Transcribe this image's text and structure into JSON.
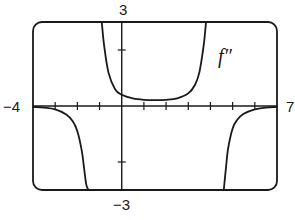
{
  "chart_data": {
    "type": "line",
    "title": "",
    "xlabel": "",
    "ylabel": "",
    "xlim": [
      -4,
      7
    ],
    "ylim": [
      -3,
      3
    ],
    "grid": false,
    "legend": null,
    "x_ticks": [
      -3,
      -2,
      -1,
      0,
      1,
      2,
      3,
      4,
      5,
      6
    ],
    "y_ticks": [
      -2,
      2
    ],
    "tick_labels": {
      "x_min": "−4",
      "x_max": "7",
      "y_max": "3",
      "y_min": "−3"
    },
    "annotations": [
      {
        "text": "f″",
        "x": 4.3,
        "y": 1.7
      }
    ],
    "series": [
      {
        "name": "f'' left branch",
        "x": [
          -4.0,
          -3.5,
          -3.0,
          -2.5,
          -2.2,
          -2.0,
          -1.8,
          -1.7,
          -1.6,
          -1.5
        ],
        "y": [
          -0.03,
          -0.06,
          -0.12,
          -0.3,
          -0.55,
          -0.9,
          -1.6,
          -2.2,
          -2.8,
          -3.0
        ]
      },
      {
        "name": "f'' middle branch",
        "x": [
          -0.9,
          -0.8,
          -0.6,
          -0.3,
          0.0,
          0.5,
          1.0,
          1.5,
          2.0,
          2.5,
          3.0,
          3.3,
          3.5,
          3.7,
          3.8
        ],
        "y": [
          3.0,
          2.2,
          1.2,
          0.6,
          0.4,
          0.27,
          0.22,
          0.21,
          0.22,
          0.27,
          0.45,
          0.75,
          1.2,
          2.2,
          3.0
        ]
      },
      {
        "name": "f'' right branch",
        "x": [
          4.6,
          4.7,
          4.8,
          5.0,
          5.2,
          5.5,
          6.0,
          6.5,
          7.0
        ],
        "y": [
          -3.0,
          -2.2,
          -1.5,
          -0.8,
          -0.5,
          -0.28,
          -0.12,
          -0.06,
          -0.03
        ]
      }
    ],
    "frame": {
      "style": "rounded-rectangle"
    }
  }
}
